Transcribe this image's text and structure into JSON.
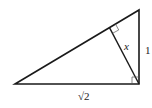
{
  "diagram": {
    "type": "right-triangle-with-altitude",
    "labels": {
      "altitude": "x",
      "vertical_leg": "1",
      "horizontal_leg": "√2"
    },
    "colors": {
      "stroke": "#1a1a1a",
      "background": "#ffffff"
    }
  }
}
